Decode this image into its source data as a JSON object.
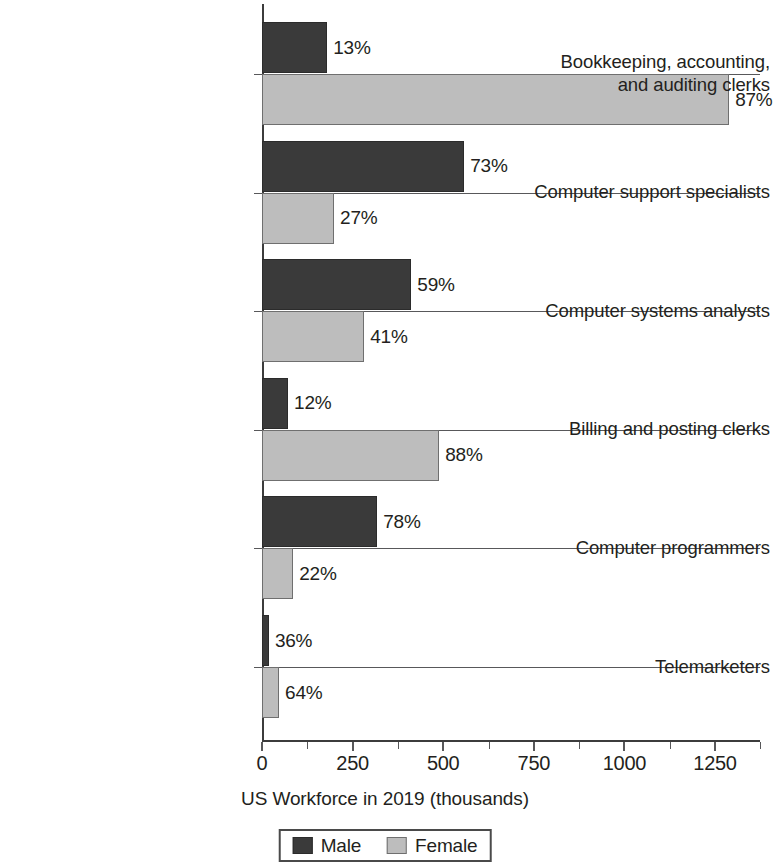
{
  "chart_data": {
    "type": "bar",
    "orientation": "horizontal",
    "title": "",
    "xlabel": "US Workforce in 2019 (thousands)",
    "ylabel": "",
    "xlim": [
      0,
      1375
    ],
    "xticks": [
      0,
      250,
      500,
      750,
      1000,
      1250
    ],
    "xtick_labels": [
      "0",
      "250",
      "500",
      "750",
      "1000",
      "1250"
    ],
    "minor_tick_step": 125,
    "grid": false,
    "legend_position": "bottom-center",
    "categories": [
      "Bookkeeping, accounting,\nand auditing clerks",
      "Computer support specialists",
      "Computer systems analysts",
      "Billing and posting clerks",
      "Computer programmers",
      "Telemarketers"
    ],
    "series": [
      {
        "name": "Male",
        "color": "#3a3a3a",
        "values": [
          180,
          558,
          412,
          72,
          318,
          19
        ],
        "data_labels": [
          "13%",
          "73%",
          "59%",
          "12%",
          "78%",
          "36%"
        ]
      },
      {
        "name": "Female",
        "color": "#bdbdbd",
        "values": [
          1289,
          199,
          282,
          489,
          86,
          47
        ],
        "data_labels": [
          "87%",
          "27%",
          "41%",
          "88%",
          "22%",
          "64%"
        ]
      }
    ]
  },
  "legend": {
    "items": [
      {
        "label": "Male",
        "swatch": "male-swatch"
      },
      {
        "label": "Female",
        "swatch": "female-swatch"
      }
    ]
  },
  "axis": {
    "x_title": "US Workforce in 2019 (thousands)"
  }
}
